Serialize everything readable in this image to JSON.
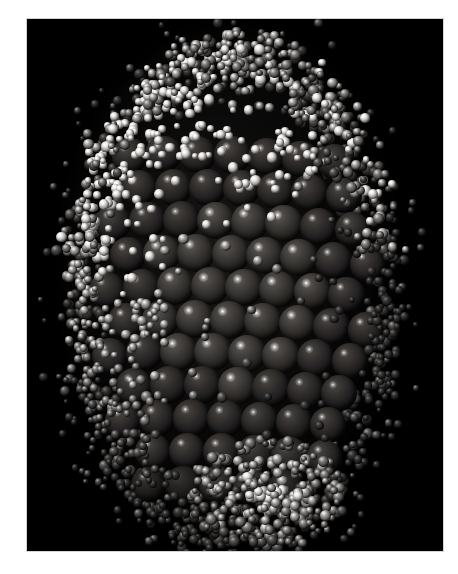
{
  "figure": {
    "kind": "molecular-space-filling-model",
    "caption": "",
    "title": "",
    "background_color": "#000000",
    "page_color": "#ffffff",
    "border_color": "#d4d4d4"
  },
  "canvas": {
    "width_px": 458,
    "height_px": 574,
    "panel_left_px": 27,
    "panel_top_px": 19,
    "panel_width_px": 416,
    "panel_height_px": 532
  },
  "render": {
    "style": "space-filling / CPK spheres",
    "shading": "specular Phong, single light source from upper left",
    "projection": "orthographic",
    "light_direction": "upper-left",
    "specular_highlight_color": "#ffffff"
  },
  "structure": {
    "overall_shape": "ovoid / prolate particle",
    "bounding_box_in_panel": {
      "x": 45,
      "y": 26,
      "width": 320,
      "height": 505
    },
    "layers": [
      {
        "name": "inner core lattice",
        "description": "large dark spheres in a hexagonal close-packed arrangement forming curved rows",
        "atom_count_visible": 104,
        "atom_diameter_px": 38,
        "color_base": "#34312f",
        "color_shadow": "#050505",
        "rows": 11,
        "row_spacing_px": 33
      },
      {
        "name": "outer shell",
        "description": "many small light-grey spheres forming a granular surface coat",
        "atom_count_visible": 1520,
        "atom_diameter_px_min": 6,
        "atom_diameter_px_max": 11,
        "color_base": "#8e8c89",
        "color_bright": "#eceae6",
        "color_dark": "#434140"
      }
    ],
    "features": [
      {
        "name": "bright diagonal band",
        "description": "band of high-luminance shell atoms sweeping from upper-left across the top of the core",
        "region": {
          "x": 60,
          "y": 90,
          "width": 230,
          "height": 120
        }
      },
      {
        "name": "exposed core facet",
        "description": "region where the shell is absent and the ordered lattice of large dark spheres is directly visible",
        "region": {
          "x": 140,
          "y": 170,
          "width": 200,
          "height": 280
        }
      },
      {
        "name": "lower shell lobe",
        "description": "cluster of small spheres projecting below the main body",
        "region": {
          "x": 160,
          "y": 420,
          "width": 160,
          "height": 110
        }
      }
    ]
  },
  "palette": {
    "panel_background": "#000000",
    "core_highlight": "#5c5855",
    "core_midtone": "#34312f",
    "core_shadow": "#050505",
    "shell_highlight": "#eceae6",
    "shell_midtone": "#8e8c89",
    "shell_shadow": "#2b2a29",
    "page_white": "#ffffff"
  }
}
